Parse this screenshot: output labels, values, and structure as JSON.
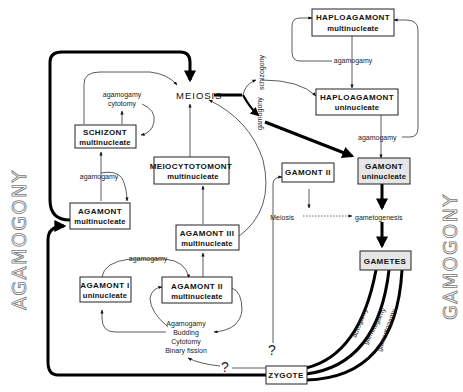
{
  "side_labels": {
    "left": "AGAMOGONY",
    "right": "GAMOGONY"
  },
  "center": {
    "meiosis": "MEIOSIS",
    "meiosis_small": "Meiosis",
    "gametogenesis": "gametogenesis"
  },
  "boxes": {
    "haploagamont_multi": {
      "line1": "HAPLOAGAMONT",
      "line2": "multinucleate"
    },
    "haploagamont_uni": {
      "line1": "HAPLOAGAMONT",
      "line2": "uninucleate"
    },
    "gamont_uni": {
      "line1": "GAMONT",
      "line2": "uninucleate"
    },
    "gamont_ii": {
      "line1": "GAMONT  II"
    },
    "gametes": {
      "line1": "GAMETES"
    },
    "zygote": {
      "line1": "ZYGOTE"
    },
    "schizont": {
      "line1": "SCHIZONT",
      "line2": "multinucleate"
    },
    "agamont_multi": {
      "line1": "AGAMONT",
      "line2": "multinucleate"
    },
    "meiocytotomont": {
      "line1": "MEIOCYTOTOMONT",
      "line2": "multinucleate"
    },
    "agamont_iii": {
      "line1": "AGAMONT  III",
      "line2": "multinucleate"
    },
    "agamont_ii": {
      "line1": "AGAMONT  II",
      "line2": "multinucleate"
    },
    "agamont_i": {
      "line1": "AGAMONT  I",
      "line2": "uninucleate"
    }
  },
  "edge_labels": {
    "agamogamy_top": "agamogamy",
    "agamogamy_right": "agamogamy",
    "schizogony": "schizogony",
    "gamogony": "gamogony",
    "schizont_loop_1": "agamogamy",
    "schizont_loop_2": "cytotomy",
    "agamont_multi_up": "agamogamy",
    "agamont_i_ii": "agamogamy",
    "autogamy": "autogamy",
    "gametogamy": "gametogamy",
    "gamontogamy": "gamontogamy",
    "question_1": "?",
    "question_2": "?"
  },
  "processes": [
    "Agamogamy",
    "Budding",
    "Cytotomy",
    "Binary  fission"
  ]
}
